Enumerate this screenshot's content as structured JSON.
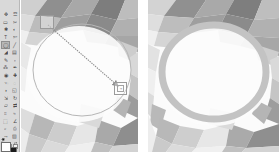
{
  "app": {
    "name": "GIMP Image Editor",
    "window_title": "Ellipse Select / Stroke Selection"
  },
  "toolbox": {
    "name": "Toolbox",
    "tools": [
      {
        "id": "move-tool",
        "label": "Move",
        "glyph": "✥",
        "active": false
      },
      {
        "id": "alignment-tool",
        "label": "Alignment",
        "glyph": "☲",
        "active": false
      },
      {
        "id": "rectangle-select-tool",
        "label": "Rectangle Select",
        "glyph": "▭",
        "active": false
      },
      {
        "id": "free-select-tool",
        "label": "Free Select",
        "glyph": "✂",
        "active": false
      },
      {
        "id": "fuzzy-select-tool",
        "label": "Fuzzy Select",
        "glyph": "✱",
        "active": false
      },
      {
        "id": "select-by-color-tool",
        "label": "Select by Color",
        "glyph": "◐",
        "active": false
      },
      {
        "id": "text-tool",
        "label": "Text",
        "glyph": "T",
        "active": false
      },
      {
        "id": "scissors-select-tool",
        "label": "Intelligent Scissors",
        "glyph": "✄",
        "active": false
      },
      {
        "id": "ellipse-select-tool",
        "label": "Ellipse Select",
        "glyph": "◯",
        "active": true
      },
      {
        "id": "pencil-tool",
        "label": "Pencil",
        "glyph": "╱",
        "active": false
      },
      {
        "id": "bucket-fill-tool",
        "label": "Bucket Fill",
        "glyph": "◢",
        "active": false
      },
      {
        "id": "gradient-tool",
        "label": "Gradient",
        "glyph": "▤",
        "active": false
      },
      {
        "id": "paintbrush-tool",
        "label": "Paintbrush",
        "glyph": "✎",
        "active": false
      },
      {
        "id": "eraser-tool",
        "label": "Eraser",
        "glyph": "▫",
        "active": false
      },
      {
        "id": "airbrush-tool",
        "label": "Airbrush",
        "glyph": "⁂",
        "active": false
      },
      {
        "id": "ink-tool",
        "label": "Ink",
        "glyph": "✒",
        "active": false
      },
      {
        "id": "clone-tool",
        "label": "Clone",
        "glyph": "◉",
        "active": false
      },
      {
        "id": "heal-tool",
        "label": "Heal",
        "glyph": "✚",
        "active": false
      },
      {
        "id": "smudge-tool",
        "label": "Smudge",
        "glyph": "☜",
        "active": false
      },
      {
        "id": "blur-sharpen-tool",
        "label": "Blur / Sharpen",
        "glyph": "◌",
        "active": false
      },
      {
        "id": "dodge-burn-tool",
        "label": "Dodge / Burn",
        "glyph": "◑",
        "active": false
      },
      {
        "id": "perspective-tool",
        "label": "Perspective",
        "glyph": "◱",
        "active": false
      },
      {
        "id": "scale-tool",
        "label": "Scale",
        "glyph": "⇲",
        "active": false
      },
      {
        "id": "rotate-tool",
        "label": "Rotate",
        "glyph": "↻",
        "active": false
      },
      {
        "id": "shear-tool",
        "label": "Shear",
        "glyph": "▱",
        "active": false
      },
      {
        "id": "flip-tool",
        "label": "Flip",
        "glyph": "⇄",
        "active": false
      },
      {
        "id": "crop-tool",
        "label": "Crop",
        "glyph": "⌗",
        "active": false
      },
      {
        "id": "warp-tool",
        "label": "Warp Transform",
        "glyph": "≈",
        "active": false
      },
      {
        "id": "cage-transform-tool",
        "label": "Cage Transform",
        "glyph": "⬚",
        "active": false
      },
      {
        "id": "measure-tool",
        "label": "Measure",
        "glyph": "∠",
        "active": false
      },
      {
        "id": "zoom-tool",
        "label": "Zoom",
        "glyph": "⌕",
        "active": false
      },
      {
        "id": "color-picker-tool",
        "label": "Color Picker",
        "glyph": "⎙",
        "active": false
      },
      {
        "id": "paths-tool",
        "label": "Paths",
        "glyph": "⤳",
        "active": false
      },
      {
        "id": "foreground-select",
        "label": "Foreground Select",
        "glyph": "▨",
        "active": false
      }
    ],
    "colors": {
      "foreground_label": "Foreground color",
      "foreground": "#ffffff",
      "background_label": "Background color",
      "background": "#1b1b1b",
      "reset_label": "Reset colors",
      "swap_label": "Swap colors"
    },
    "indicators": {
      "brush_label": "Active brush",
      "pattern_label": "Active pattern",
      "gradient_label": "Active gradient",
      "image_label": "Active image"
    }
  },
  "canvas_left": {
    "name": "Before canvas",
    "title": "Ellipse selection in progress",
    "image_alt": "Low-poly abstract grayscale texture",
    "selection": {
      "shape": "ellipse",
      "stroke_color": "#b6b6b6",
      "handle_tl_label": "Top-left resize handle",
      "handle_br_label": "Bottom-right resize handle",
      "handle_br_glyph": "⌖",
      "drag_arrow_label": "Drag direction arrow",
      "drag_arrow_color": "#8c8c8c"
    }
  },
  "canvas_right": {
    "name": "After canvas",
    "title": "Stroked selection result",
    "image_alt": "Low-poly abstract grayscale texture",
    "ring": {
      "shape": "ellipse-ring",
      "stroke_color": "#c3c3c3",
      "stroke_width": 7
    }
  },
  "palette": {
    "canvas_bg": "#fbfbfb",
    "toolbox_bg": "#d9d9d9",
    "poly_light": "#f2f2f2",
    "poly_mid": "#c9c9c9",
    "poly_dark": "#9a9a9a",
    "poly_darker": "#777777"
  }
}
